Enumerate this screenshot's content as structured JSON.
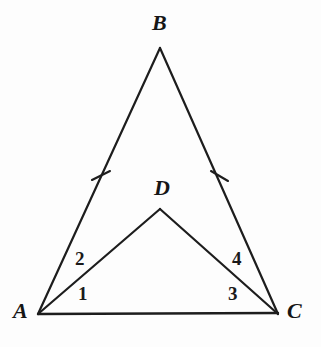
{
  "figure": {
    "canvas": {
      "width": 321,
      "height": 347
    },
    "background_color": "#fdfdfd",
    "stroke_color": "#1d1d1d",
    "stroke_width": 2.2,
    "text_color": "#161616"
  },
  "vertices": [
    {
      "id": "A",
      "label": "A",
      "x": 38,
      "y": 314,
      "label_x": 13,
      "label_y": 300
    },
    {
      "id": "B",
      "label": "B",
      "x": 160,
      "y": 48,
      "label_x": 152,
      "label_y": 12
    },
    {
      "id": "C",
      "label": "C",
      "x": 278,
      "y": 314,
      "label_x": 287,
      "label_y": 300
    },
    {
      "id": "D",
      "label": "D",
      "x": 160,
      "y": 209,
      "label_x": 154,
      "label_y": 177
    }
  ],
  "segments": [
    {
      "id": "AB",
      "from": "A",
      "to": "B",
      "x1": 38,
      "y1": 314,
      "x2": 160,
      "y2": 48
    },
    {
      "id": "BC",
      "from": "B",
      "to": "C",
      "x1": 160,
      "y1": 48,
      "x2": 278,
      "y2": 314
    },
    {
      "id": "AC",
      "from": "A",
      "to": "C",
      "x1": 38,
      "y1": 314,
      "x2": 278,
      "y2": 313
    },
    {
      "id": "AD",
      "from": "A",
      "to": "D",
      "x1": 38,
      "y1": 314,
      "x2": 160,
      "y2": 209
    },
    {
      "id": "DC",
      "from": "D",
      "to": "C",
      "x1": 160,
      "y1": 209,
      "x2": 278,
      "y2": 314
    }
  ],
  "tick_marks": [
    {
      "id": "tick-AB",
      "on_segment": "AB",
      "x1": 92,
      "y1": 180,
      "x2": 110,
      "y2": 171
    },
    {
      "id": "tick-BC",
      "on_segment": "BC",
      "x1": 211,
      "y1": 171,
      "x2": 228,
      "y2": 181
    }
  ],
  "angle_labels": [
    {
      "id": "angle-1",
      "label": "1",
      "at_vertex": "A",
      "x": 78,
      "y": 284
    },
    {
      "id": "angle-2",
      "label": "2",
      "at_vertex": "A",
      "x": 75,
      "y": 249
    },
    {
      "id": "angle-3",
      "label": "3",
      "at_vertex": "C",
      "x": 228,
      "y": 284
    },
    {
      "id": "angle-4",
      "label": "4",
      "at_vertex": "C",
      "x": 232,
      "y": 249
    }
  ]
}
